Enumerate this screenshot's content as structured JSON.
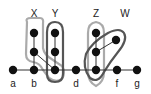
{
  "diagram": {
    "top_labels": [
      "X",
      "Y",
      "Z",
      "W"
    ],
    "bottom_labels": [
      "a",
      "b",
      "d",
      "f",
      "g"
    ],
    "colors": {
      "node": "#111111",
      "edge": "#333333",
      "light_outline": "#aaaaaa",
      "dark_outline": "#555555"
    }
  }
}
